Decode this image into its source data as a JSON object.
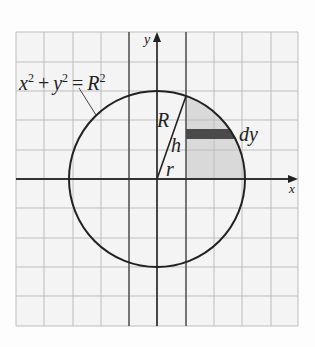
{
  "diagram": {
    "type": "circle-on-grid",
    "equation_label": {
      "base_x": "x",
      "exp_x": "2",
      "plus": "+",
      "base_y": "y",
      "exp_y": "2",
      "eq": "=",
      "base_R": "R",
      "exp_R": "2"
    },
    "axis_labels": {
      "x": "x",
      "y": "y"
    },
    "segment_labels": {
      "R": "R",
      "h": "h",
      "r": "r",
      "dy": "dy"
    },
    "grid": {
      "columns": 10,
      "rows": 10,
      "left": 16,
      "top": 32,
      "right": 298,
      "bottom": 326
    },
    "circle": {
      "cx": 157,
      "cy": 179,
      "radius": 88
    },
    "shaded_region": {
      "description": "region between x=r line and circle, above x-axis",
      "fill": "#d9d9d9"
    },
    "strip": {
      "label": "dy",
      "fill": "#4a4a4a"
    },
    "colors": {
      "grid_minor": "#bdbdbd",
      "grid_major": "#555555",
      "stroke": "#222222",
      "shade": "#d9d9d9",
      "strip": "#4a4a4a"
    }
  }
}
